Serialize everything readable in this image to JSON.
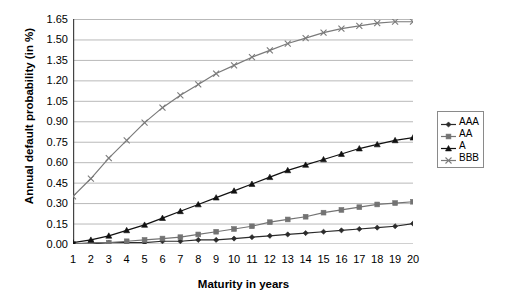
{
  "chart_data": {
    "type": "line",
    "title": "",
    "xlabel": "Maturity in years",
    "ylabel": "Annual default probability (in %)",
    "x": [
      1,
      2,
      3,
      4,
      5,
      6,
      7,
      8,
      9,
      10,
      11,
      12,
      13,
      14,
      15,
      16,
      17,
      18,
      19,
      20
    ],
    "xtick_labels": [
      "1",
      "2",
      "3",
      "4",
      "5",
      "6",
      "7",
      "8",
      "9",
      "10",
      "11",
      "12",
      "13",
      "14",
      "15",
      "16",
      "17",
      "18",
      "19",
      "20"
    ],
    "ytick_labels": [
      "0.00",
      "0.15",
      "0.30",
      "0.45",
      "0.60",
      "0.75",
      "0.90",
      "1.05",
      "1.20",
      "1.35",
      "1.50",
      "1.65"
    ],
    "ytick_values": [
      0.0,
      0.15,
      0.3,
      0.45,
      0.6,
      0.75,
      0.9,
      1.05,
      1.2,
      1.35,
      1.5,
      1.65
    ],
    "xlim": [
      1,
      20
    ],
    "ylim": [
      0.0,
      1.65
    ],
    "grid": "horizontal",
    "legend_position": "right",
    "series": [
      {
        "name": "AAA",
        "marker": "diamond",
        "color": "#2b2b2b",
        "values": [
          0.0,
          0.0,
          0.01,
          0.01,
          0.01,
          0.02,
          0.02,
          0.03,
          0.03,
          0.04,
          0.05,
          0.06,
          0.07,
          0.08,
          0.09,
          0.1,
          0.11,
          0.12,
          0.13,
          0.15
        ]
      },
      {
        "name": "AA",
        "marker": "square",
        "color": "#737373",
        "values": [
          0.0,
          0.01,
          0.01,
          0.02,
          0.03,
          0.04,
          0.05,
          0.07,
          0.09,
          0.11,
          0.13,
          0.16,
          0.18,
          0.2,
          0.23,
          0.25,
          0.27,
          0.29,
          0.3,
          0.31
        ]
      },
      {
        "name": "A",
        "marker": "triangle",
        "color": "#111111",
        "values": [
          0.01,
          0.03,
          0.06,
          0.1,
          0.14,
          0.19,
          0.24,
          0.29,
          0.34,
          0.39,
          0.44,
          0.49,
          0.54,
          0.58,
          0.62,
          0.66,
          0.7,
          0.73,
          0.76,
          0.78
        ]
      },
      {
        "name": "BBB",
        "marker": "cross",
        "color": "#7a7a7a",
        "values": [
          0.35,
          0.48,
          0.63,
          0.76,
          0.89,
          1.0,
          1.09,
          1.17,
          1.25,
          1.31,
          1.37,
          1.42,
          1.47,
          1.51,
          1.55,
          1.58,
          1.6,
          1.62,
          1.63,
          1.63
        ]
      }
    ]
  },
  "legend": {
    "items": [
      {
        "label": "AAA"
      },
      {
        "label": "AA"
      },
      {
        "label": "A"
      },
      {
        "label": "BBB"
      }
    ]
  }
}
